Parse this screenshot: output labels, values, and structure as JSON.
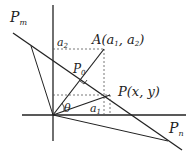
{
  "diagram": {
    "type": "coordinate-geometry",
    "labels": {
      "pm": "P",
      "pm_sub": "m",
      "pn": "P",
      "pn_sub": "n",
      "a": "A(a",
      "a_sub1": "1",
      "a_mid": ", a",
      "a_sub2": "2",
      "a_end": ")",
      "p0": "P",
      "p0_sub": "0",
      "p": "P(x, y)",
      "a1": "a",
      "a1_sub": "1",
      "a2": "a",
      "a2_sub": "2",
      "theta": "θ"
    },
    "colors": {
      "line": "#222222",
      "dashed": "#555555"
    }
  }
}
